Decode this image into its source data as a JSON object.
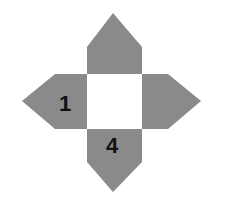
{
  "diagram": {
    "type": "pyramid-net",
    "colors": {
      "face": "#8a8a8a",
      "center": "#ffffff",
      "label": "#111111",
      "background": "#ffffff"
    },
    "center_square": {
      "x": 87,
      "y": 74,
      "size": 55
    },
    "faces": [
      {
        "id": "top",
        "label": ""
      },
      {
        "id": "left",
        "label": "1"
      },
      {
        "id": "right",
        "label": ""
      },
      {
        "id": "bottom",
        "label": "4"
      }
    ]
  }
}
